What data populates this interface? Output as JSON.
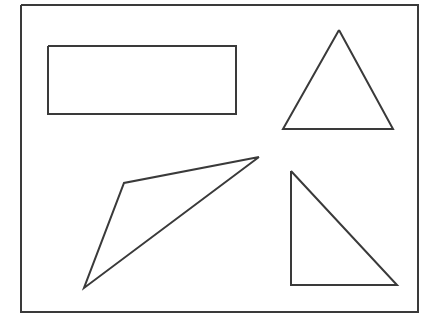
{
  "figure": {
    "canvas": {
      "width": 431,
      "height": 327,
      "background_color": "#ffffff"
    },
    "style": {
      "stroke_color": "#3a3a3a",
      "stroke_width": 2,
      "fill": "none"
    },
    "frame": {
      "label": "Outer border frame",
      "x": 21,
      "y": 5,
      "width": 397,
      "height": 307,
      "points": "21,5 418,5 418,312 21,312 21,5"
    },
    "shapes": [
      {
        "id": "rectangle",
        "label": "Rectangle",
        "kind": "rectangle",
        "x": 48,
        "y": 46,
        "width": 188,
        "height": 68,
        "points": "48,46 236,46 236,114 48,114 48,46"
      },
      {
        "id": "isosceles-triangle",
        "label": "Isosceles triangle",
        "kind": "triangle",
        "points": "339,30 393,129 283,129 339,30",
        "vertices": [
          [
            339,
            30
          ],
          [
            393,
            129
          ],
          [
            283,
            129
          ]
        ]
      },
      {
        "id": "right-triangle",
        "label": "Right triangle",
        "kind": "triangle",
        "points": "291,171 397,285 291,285 291,171",
        "vertices": [
          [
            291,
            171
          ],
          [
            397,
            285
          ],
          [
            291,
            285
          ]
        ]
      },
      {
        "id": "dart-polygon",
        "label": "Concave dart polygon",
        "kind": "polygon",
        "points": "259,157 124,183 84,288 259,157",
        "vertices": [
          [
            259,
            157
          ],
          [
            124,
            183
          ],
          [
            84,
            288
          ]
        ]
      }
    ]
  }
}
